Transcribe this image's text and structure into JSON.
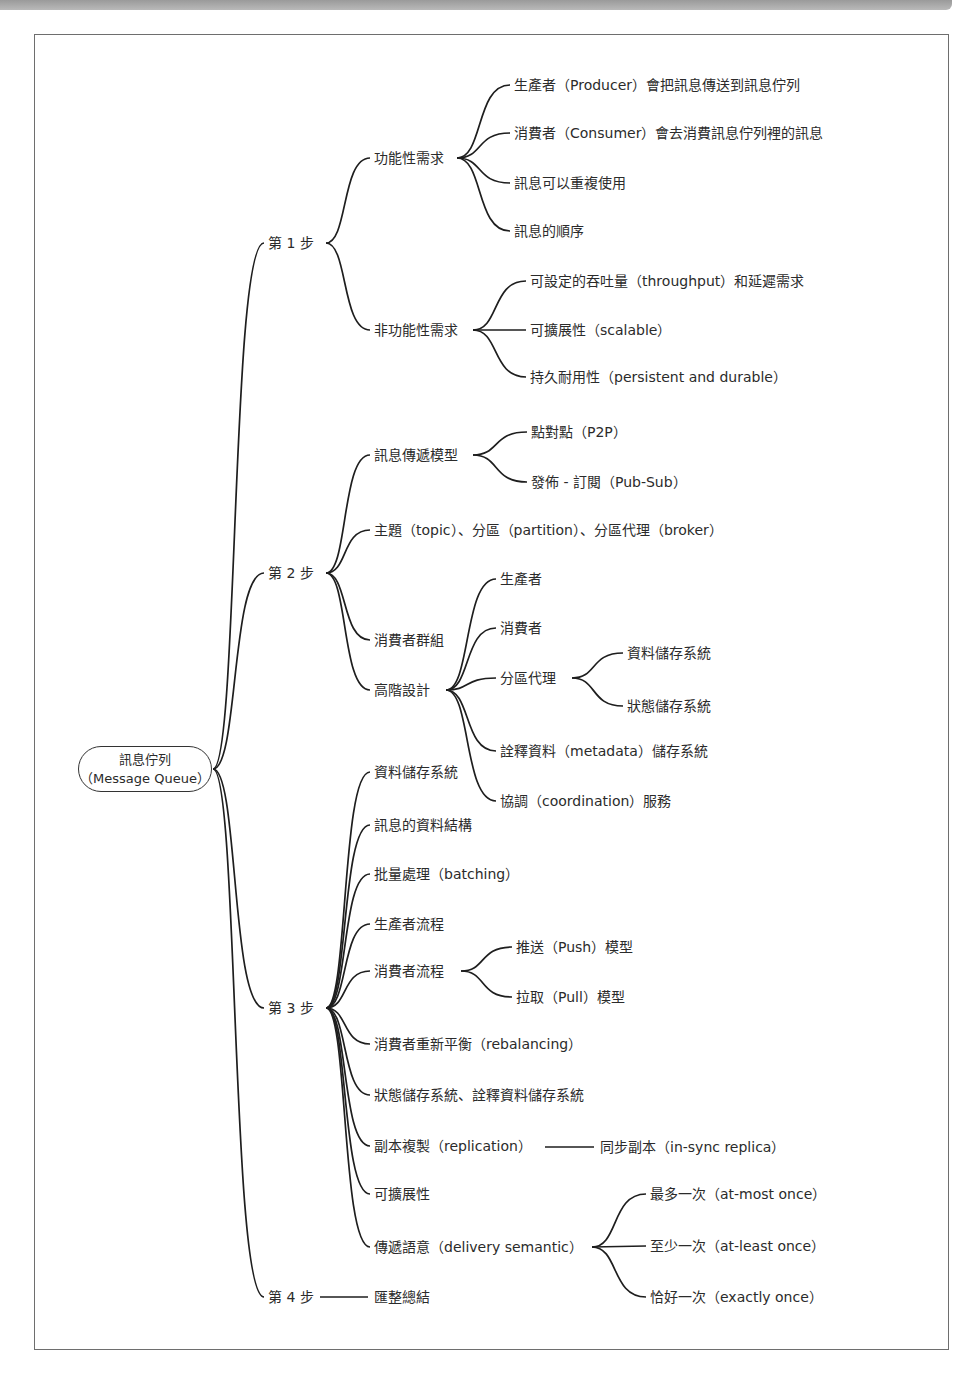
{
  "root": {
    "line1": "訊息佇列",
    "line2": "（Message Queue）"
  },
  "steps": [
    {
      "label": "第 1 步",
      "children": [
        {
          "label": "功能性需求",
          "children": [
            {
              "label": "生產者（Producer）會把訊息傳送到訊息佇列"
            },
            {
              "label": "消費者（Consumer）會去消費訊息佇列裡的訊息"
            },
            {
              "label": "訊息可以重複使用"
            },
            {
              "label": "訊息的順序"
            }
          ]
        },
        {
          "label": "非功能性需求",
          "children": [
            {
              "label": "可設定的吞吐量（throughput）和延遲需求"
            },
            {
              "label": "可擴展性（scalable）"
            },
            {
              "label": "持久耐用性（persistent and durable）"
            }
          ]
        }
      ]
    },
    {
      "label": "第 2 步",
      "children": [
        {
          "label": "訊息傳遞模型",
          "children": [
            {
              "label": "點對點（P2P）"
            },
            {
              "label": "發佈 - 訂閱（Pub-Sub）"
            }
          ]
        },
        {
          "label": "主題（topic）、分區（partition）、分區代理（broker）"
        },
        {
          "label": "消費者群組"
        },
        {
          "label": "高階設計",
          "children": [
            {
              "label": "生產者"
            },
            {
              "label": "消費者"
            },
            {
              "label": "分區代理",
              "children": [
                {
                  "label": "資料儲存系統"
                },
                {
                  "label": "狀態儲存系統"
                }
              ]
            },
            {
              "label": "詮釋資料（metadata）儲存系統"
            },
            {
              "label": "協調（coordination）服務"
            }
          ]
        }
      ]
    },
    {
      "label": "第 3 步",
      "children": [
        {
          "label": "資料儲存系統"
        },
        {
          "label": "訊息的資料結構"
        },
        {
          "label": "批量處理（batching）"
        },
        {
          "label": "生產者流程"
        },
        {
          "label": "消費者流程",
          "children": [
            {
              "label": "推送（Push）模型"
            },
            {
              "label": "拉取（Pull）模型"
            }
          ]
        },
        {
          "label": "消費者重新平衡（rebalancing）"
        },
        {
          "label": "狀態儲存系統、詮釋資料儲存系統"
        },
        {
          "label": "副本複製（replication）",
          "children": [
            {
              "label": "同步副本（in-sync replica）"
            }
          ]
        },
        {
          "label": "可擴展性"
        },
        {
          "label": "傳遞語意（delivery semantic）",
          "children": [
            {
              "label": "最多一次（at-most once）"
            },
            {
              "label": "至少一次（at-least once）"
            },
            {
              "label": "恰好一次（exactly once）"
            }
          ]
        }
      ]
    },
    {
      "label": "第 4 步",
      "children": [
        {
          "label": "匯整總結"
        }
      ]
    }
  ]
}
